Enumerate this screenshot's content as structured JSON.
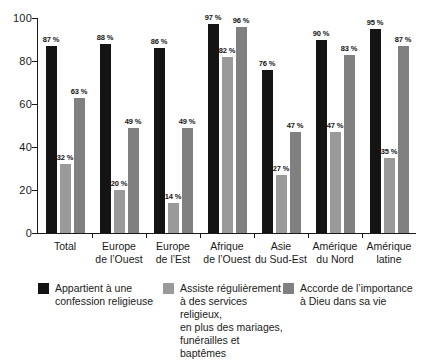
{
  "chart_data": {
    "type": "bar",
    "title": "",
    "subtitle": "",
    "xlabel": "",
    "ylabel": "",
    "ylim": [
      0,
      100
    ],
    "yticks": [
      0,
      20,
      40,
      60,
      80,
      100
    ],
    "grid": false,
    "legend_position": "bottom",
    "value_suffix": "%",
    "categories": [
      {
        "line1": "Total",
        "line2": ""
      },
      {
        "line1": "Europe",
        "line2": "de l’Ouest"
      },
      {
        "line1": "Europe",
        "line2": "de l’Est"
      },
      {
        "line1": "Afrique",
        "line2": "de l’Ouest"
      },
      {
        "line1": "Asie",
        "line2": "du Sud-Est"
      },
      {
        "line1": "Amérique",
        "line2": "du Nord"
      },
      {
        "line1": "Amérique",
        "line2": "latine"
      }
    ],
    "series": [
      {
        "name": "Appartient à une confession religieuse",
        "color": "#141414",
        "values": [
          87,
          88,
          86,
          97,
          76,
          90,
          95
        ],
        "labels": [
          "87 %",
          "88 %",
          "86 %",
          "97 %",
          "76 %",
          "90 %",
          "95 %"
        ]
      },
      {
        "name": "Assiste régulièrement à des services religieux, en plus des mariages, funérailles et baptêmes",
        "color": "#9a9a9a",
        "values": [
          32,
          20,
          14,
          82,
          27,
          47,
          35
        ],
        "labels": [
          "32 %",
          "20 %",
          "14 %",
          "82 %",
          "27 %",
          "47 %",
          "35 %"
        ]
      },
      {
        "name": "Accorde de l’importance à Dieu dans sa vie",
        "color": "#808080",
        "values": [
          63,
          49,
          49,
          96,
          47,
          83,
          87
        ],
        "labels": [
          "63 %",
          "49 %",
          "49 %",
          "96 %",
          "47 %",
          "83 %",
          "87 %"
        ]
      }
    ]
  },
  "axis": {
    "y_tick_labels": [
      "100",
      "80",
      "60",
      "40",
      "20",
      "0"
    ]
  },
  "legend": {
    "items": [
      {
        "swatch_color": "#141414",
        "lines": [
          "Appartient à une",
          "confession religieuse"
        ]
      },
      {
        "swatch_color": "#9a9a9a",
        "lines": [
          "Assiste régulièrement",
          "à des services religieux,",
          "en plus des mariages,",
          "funérailles et baptêmes"
        ]
      },
      {
        "swatch_color": "#808080",
        "lines": [
          "Accorde de l’importance",
          "à Dieu dans sa vie"
        ]
      }
    ]
  }
}
